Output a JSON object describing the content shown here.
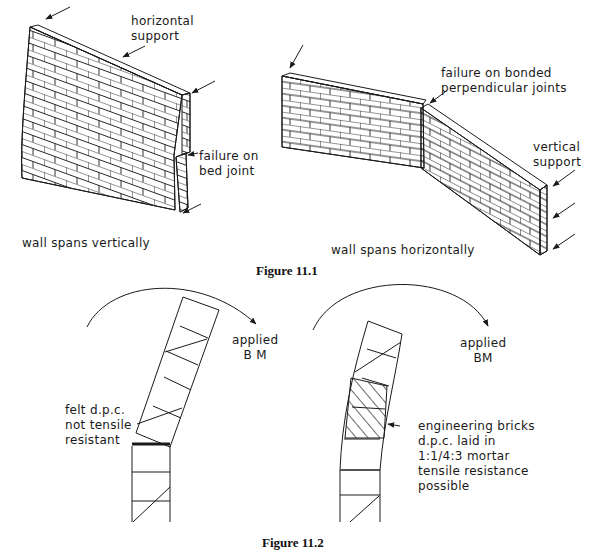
{
  "figure_1": {
    "caption": "Figure 11.1",
    "left_wall": {
      "title": "wall spans vertically",
      "labels": {
        "support": "horizontal\nsupport",
        "failure": "failure on\nbed joint"
      }
    },
    "right_wall": {
      "title": "wall spans horizontally",
      "labels": {
        "failure": "failure on bonded\nperpendicular joints",
        "support": "vertical\nsupport"
      }
    }
  },
  "figure_2": {
    "caption": "Figure 11.2",
    "left_pier": {
      "moment_label": "applied\nB M",
      "dpc_label": "felt d.p.c.\nnot tensile\nresistant"
    },
    "right_pier": {
      "moment_label": "applied\nBM",
      "dpc_label": "engineering bricks\nd.p.c. laid in\n1:1/4:3 mortar\ntensile resistance\npossible"
    }
  },
  "colors": {
    "line": "#1a1a1a",
    "background": "#ffffff"
  }
}
